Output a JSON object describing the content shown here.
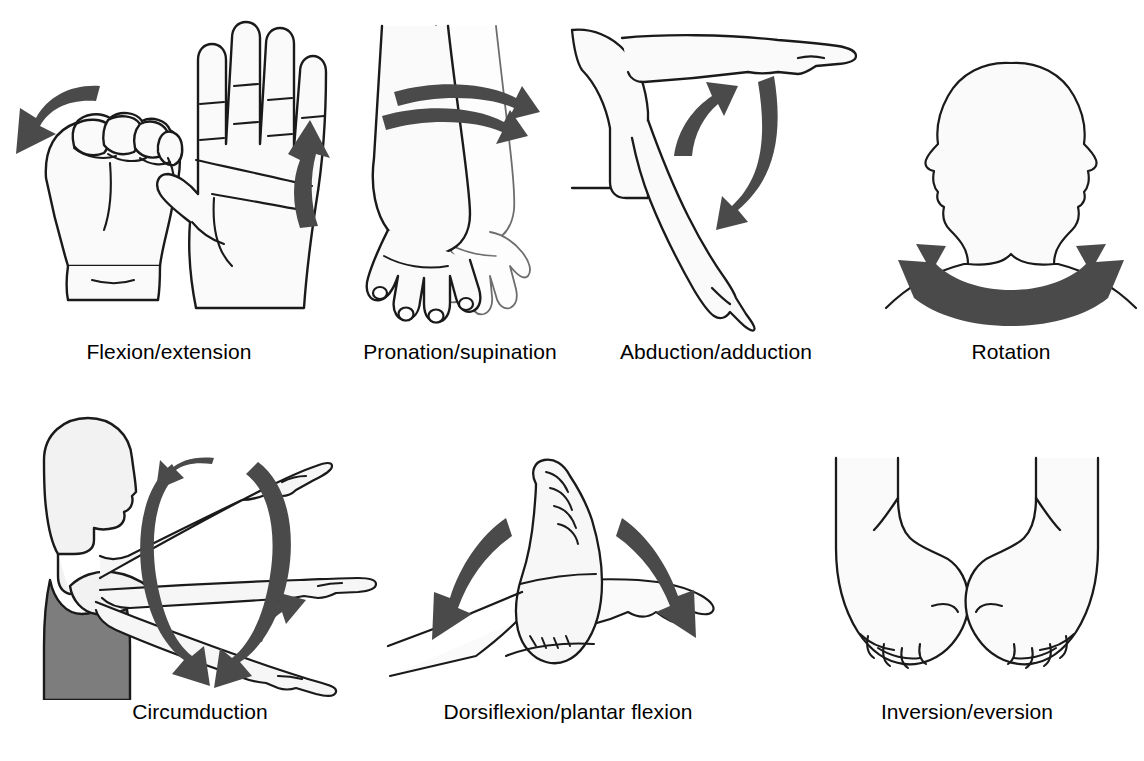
{
  "figure": {
    "background_color": "#ffffff",
    "label_color": "#000000",
    "outline_color": "#1a1a1a",
    "arrow_color": "#4a4a4a",
    "skin_fill": "#fafafa",
    "garment_fill": "#7d7d7d",
    "columns": 4,
    "rows": 2
  },
  "panels": [
    {
      "id": "flexion-extension",
      "label": "Flexion/extension",
      "body_part": "hand",
      "illustration": "closed fist and open palm of a hand",
      "arrows": [
        {
          "name": "flexion-arrow",
          "shape": "curved",
          "direction": "down-left",
          "color": "#4a4a4a"
        },
        {
          "name": "extension-arrow",
          "shape": "curved",
          "direction": "up",
          "color": "#4a4a4a"
        }
      ]
    },
    {
      "id": "pronation-supination",
      "label": "Pronation/supination",
      "body_part": "forearm",
      "illustration": "two overlapping forearms with hands, palm down and palm up",
      "arrows": [
        {
          "name": "pronation-arrow",
          "shape": "curved",
          "direction": "right",
          "color": "#4a4a4a"
        },
        {
          "name": "supination-arrow",
          "shape": "curved",
          "direction": "left",
          "color": "#4a4a4a"
        }
      ]
    },
    {
      "id": "abduction-adduction",
      "label": "Abduction/adduction",
      "body_part": "arm and shoulder",
      "illustration": "arm raised horizontally and lowered alongside the torso",
      "arrows": [
        {
          "name": "abduction-arrow",
          "shape": "curved",
          "direction": "up",
          "color": "#4a4a4a"
        },
        {
          "name": "adduction-arrow",
          "shape": "curved",
          "direction": "down-left",
          "color": "#4a4a4a"
        }
      ]
    },
    {
      "id": "rotation",
      "label": "Rotation",
      "body_part": "head and neck",
      "illustration": "head shown as two mirrored profiles turning left and right",
      "arrows": [
        {
          "name": "rotation-arrow",
          "shape": "arc",
          "direction": "double-headed",
          "color": "#4a4a4a"
        }
      ]
    },
    {
      "id": "circumduction",
      "label": "Circumduction",
      "body_part": "arm and shoulder",
      "illustration": "torso in a dark tank top with the arm drawn in three positions tracing a cone",
      "arrows": [
        {
          "name": "circumduction-loop-arrow",
          "shape": "ellipse",
          "direction": "clockwise",
          "color": "#4a4a4a"
        }
      ]
    },
    {
      "id": "dorsiflexion-plantar-flexion",
      "label": "Dorsiflexion/plantar flexion",
      "body_part": "foot and ankle",
      "illustration": "foot shown upright (dorsiflexed) and pointed (plantar flexed)",
      "arrows": [
        {
          "name": "dorsiflexion-arrow",
          "shape": "curved",
          "direction": "down-left",
          "color": "#4a4a4a"
        },
        {
          "name": "plantar-flexion-arrow",
          "shape": "curved",
          "direction": "down-right",
          "color": "#4a4a4a"
        }
      ]
    },
    {
      "id": "inversion-eversion",
      "label": "Inversion/eversion",
      "body_part": "feet",
      "illustration": "two feet viewed from the front, one tilted inward and one tilted outward",
      "arrows": []
    }
  ]
}
